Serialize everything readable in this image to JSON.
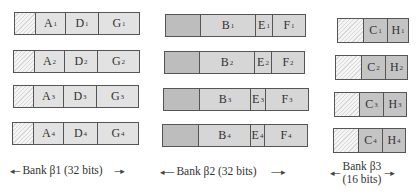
{
  "banks": [
    {
      "name": "Bank β1 (32 bits)",
      "label_line1": "Bank β1 (32 bits)",
      "padding_style": "hatched",
      "rows": [
        {
          "cells": [
            {
              "letter": "A",
              "index": "1"
            },
            {
              "letter": "D",
              "index": "1"
            },
            {
              "letter": "G",
              "index": "1"
            }
          ]
        },
        {
          "cells": [
            {
              "letter": "A",
              "index": "2"
            },
            {
              "letter": "D",
              "index": "2"
            },
            {
              "letter": "G",
              "index": "2"
            }
          ]
        },
        {
          "cells": [
            {
              "letter": "A",
              "index": "3"
            },
            {
              "letter": "D",
              "index": "3"
            },
            {
              "letter": "G",
              "index": "3"
            }
          ]
        },
        {
          "cells": [
            {
              "letter": "A",
              "index": "4"
            },
            {
              "letter": "D",
              "index": "4"
            },
            {
              "letter": "G",
              "index": "4"
            }
          ]
        }
      ]
    },
    {
      "name": "Bank β2 (32 bits)",
      "label_line1": "Bank β2 (32 bits)",
      "padding_style": "dotted",
      "rows": [
        {
          "cells": [
            {
              "letter": "B",
              "index": "1"
            },
            {
              "letter": "E",
              "index": "1"
            },
            {
              "letter": "F",
              "index": "1"
            }
          ]
        },
        {
          "cells": [
            {
              "letter": "B",
              "index": "2"
            },
            {
              "letter": "E",
              "index": "2"
            },
            {
              "letter": "F",
              "index": "2"
            }
          ]
        },
        {
          "cells": [
            {
              "letter": "B",
              "index": "3"
            },
            {
              "letter": "E",
              "index": "3"
            },
            {
              "letter": "F",
              "index": "3"
            }
          ]
        },
        {
          "cells": [
            {
              "letter": "B",
              "index": "4"
            },
            {
              "letter": "E",
              "index": "4"
            },
            {
              "letter": "F",
              "index": "4"
            }
          ]
        }
      ]
    },
    {
      "name": "Bank β3 (16 bits)",
      "label_line1": "Bank β3",
      "label_line2": "(16 bits)",
      "padding_style": "hatched",
      "rows": [
        {
          "cells": [
            {
              "letter": "C",
              "index": "1"
            },
            {
              "letter": "H",
              "index": "1"
            }
          ]
        },
        {
          "cells": [
            {
              "letter": "C",
              "index": "2"
            },
            {
              "letter": "H",
              "index": "2"
            }
          ]
        },
        {
          "cells": [
            {
              "letter": "C",
              "index": "3"
            },
            {
              "letter": "H",
              "index": "3"
            }
          ]
        },
        {
          "cells": [
            {
              "letter": "C",
              "index": "4"
            },
            {
              "letter": "H",
              "index": "4"
            }
          ]
        }
      ]
    }
  ],
  "arrows": {
    "left": "◂---",
    "right": "---▸",
    "left_long": "◂-----",
    "right_long": "-----▸"
  },
  "colors": {
    "border": "#555555",
    "cell_light": "#e2e2e2",
    "cell_mid": "#d6d6d6",
    "cell_dark": "#c4c4c4"
  }
}
